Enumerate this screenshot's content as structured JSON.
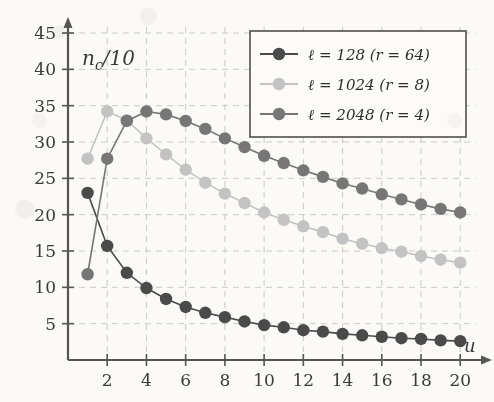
{
  "figure": {
    "background_color": "#fbfaf7",
    "axis_color": "#555555",
    "grid_color": "#cfc8c2"
  },
  "axes": {
    "ylabel": "n_c/10",
    "xlabel": "u",
    "yticks": [
      5,
      10,
      15,
      20,
      25,
      30,
      35,
      40,
      45
    ],
    "xticks": [
      2,
      4,
      6,
      8,
      10,
      12,
      14,
      16,
      18,
      20
    ],
    "ylim": [
      0,
      45
    ],
    "xlim": [
      0,
      20.6
    ]
  },
  "legend": {
    "position": "top-right",
    "entries": [
      {
        "label": "ℓ = 128 (r = 64)",
        "color": "#4a4a4a"
      },
      {
        "label": "ℓ = 1024 (r = 8)",
        "color": "#c3c3c3"
      },
      {
        "label": "ℓ = 2048 (r = 4)",
        "color": "#767676"
      }
    ]
  },
  "chart_data": {
    "type": "line",
    "title": "",
    "xlabel": "u",
    "ylabel": "n_c/10",
    "xlim": [
      0,
      20.6
    ],
    "ylim": [
      0,
      45
    ],
    "grid": true,
    "legend_position": "top-right",
    "x": [
      1,
      2,
      3,
      4,
      5,
      6,
      7,
      8,
      9,
      10,
      11,
      12,
      13,
      14,
      15,
      16,
      17,
      18,
      19,
      20
    ],
    "series": [
      {
        "name": "ℓ = 128 (r = 64)",
        "color": "#4a4a4a",
        "marker": "circle",
        "values": [
          23.0,
          15.7,
          12.0,
          9.9,
          8.4,
          7.3,
          6.5,
          5.9,
          5.3,
          4.8,
          4.5,
          4.1,
          3.9,
          3.6,
          3.4,
          3.2,
          3.0,
          2.9,
          2.7,
          2.6
        ]
      },
      {
        "name": "ℓ = 1024 (r = 8)",
        "color": "#c3c3c3",
        "marker": "circle",
        "values": [
          27.7,
          34.2,
          33.0,
          30.5,
          28.3,
          26.2,
          24.4,
          22.9,
          21.6,
          20.3,
          19.3,
          18.4,
          17.6,
          16.7,
          16.0,
          15.4,
          14.9,
          14.3,
          13.8,
          13.4
        ]
      },
      {
        "name": "ℓ = 2048 (r = 4)",
        "color": "#767676",
        "marker": "circle",
        "values": [
          11.8,
          27.7,
          32.9,
          34.2,
          33.8,
          32.9,
          31.8,
          30.5,
          29.3,
          28.1,
          27.1,
          26.1,
          25.2,
          24.3,
          23.6,
          22.8,
          22.1,
          21.4,
          20.8,
          20.3
        ]
      }
    ]
  }
}
